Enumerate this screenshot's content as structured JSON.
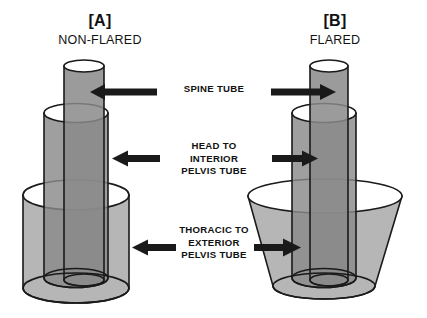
{
  "figure": {
    "background_color": "#ffffff",
    "line_color": "#1a1a1a",
    "arrow_color": "#1a1a1a",
    "panels": [
      {
        "id": "A",
        "title": "[A]",
        "subtitle": "NON-FLARED",
        "tubes": [
          {
            "name": "spine-tube",
            "shape": "cylinder",
            "fill": "#9a9a9a"
          },
          {
            "name": "head-interior-pelvis-tube",
            "shape": "cylinder",
            "fill": "#8d8d8d"
          },
          {
            "name": "thoracic-exterior-pelvis-tube",
            "shape": "cylinder",
            "fill": "#a8a8a8"
          }
        ]
      },
      {
        "id": "B",
        "title": "[B]",
        "subtitle": "FLARED",
        "tubes": [
          {
            "name": "spine-tube",
            "shape": "cylinder",
            "fill": "#9a9a9a"
          },
          {
            "name": "head-interior-pelvis-tube",
            "shape": "cylinder",
            "fill": "#8d8d8d"
          },
          {
            "name": "thoracic-exterior-pelvis-tube",
            "shape": "flared-cone",
            "fill": "#a8a8a8"
          }
        ]
      }
    ],
    "callouts": [
      {
        "name": "spine-tube-callout",
        "label": "SPINE TUBE"
      },
      {
        "name": "head-to-interior-pelvis-tube-callout",
        "label": "HEAD TO\nINTERIOR\nPELVIS TUBE"
      },
      {
        "name": "thoracic-to-exterior-pelvis-tube-callout",
        "label": "THORACIC TO\nEXTERIOR\nPELVIS TUBE"
      }
    ]
  }
}
